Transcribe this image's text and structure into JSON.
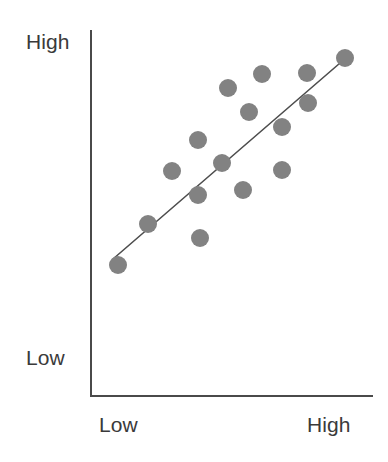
{
  "chart_data": {
    "type": "scatter",
    "title": "",
    "subtitle": "",
    "xlabel": "",
    "ylabel": "",
    "xtick_labels": [
      "Low",
      "High"
    ],
    "ytick_labels": [
      "Low",
      "High"
    ],
    "xlim": [
      0,
      1
    ],
    "ylim": [
      0,
      1
    ],
    "grid": false,
    "legend": null,
    "annotations": [],
    "series": [
      {
        "name": "observations",
        "marker": "circle",
        "color": "#828282",
        "marker_radius_px": 9,
        "points_px": [
          {
            "x": 118,
            "y": 265
          },
          {
            "x": 148,
            "y": 224
          },
          {
            "x": 172,
            "y": 171
          },
          {
            "x": 198,
            "y": 140
          },
          {
            "x": 198,
            "y": 195
          },
          {
            "x": 222,
            "y": 163
          },
          {
            "x": 228,
            "y": 88
          },
          {
            "x": 243,
            "y": 190
          },
          {
            "x": 249,
            "y": 112
          },
          {
            "x": 262,
            "y": 74
          },
          {
            "x": 282,
            "y": 127
          },
          {
            "x": 282,
            "y": 170
          },
          {
            "x": 307,
            "y": 73
          },
          {
            "x": 308,
            "y": 103
          },
          {
            "x": 345,
            "y": 58
          },
          {
            "x": 200,
            "y": 238
          }
        ],
        "x": [
          0.02,
          0.13,
          0.22,
          0.32,
          0.32,
          0.41,
          0.44,
          0.5,
          0.52,
          0.57,
          0.65,
          0.65,
          0.74,
          0.74,
          0.88,
          0.33
        ],
        "y": [
          0.26,
          0.37,
          0.52,
          0.6,
          0.44,
          0.53,
          0.73,
          0.45,
          0.67,
          0.78,
          0.63,
          0.51,
          0.79,
          0.71,
          0.83,
          0.18
        ]
      }
    ],
    "trendline": {
      "name": "fit-line",
      "color": "#4d4d4d",
      "width_px": 1.6,
      "start_px": {
        "x": 113,
        "y": 259
      },
      "end_px": {
        "x": 347,
        "y": 57
      },
      "slope_note": "positive"
    },
    "axes": {
      "color": "#4a4a4a",
      "width_px": 2,
      "y_axis_px": {
        "x": 90,
        "y_top": 30,
        "y_bottom": 396
      },
      "x_axis_px": {
        "y": 396,
        "x_left": 90,
        "x_right": 373
      }
    }
  },
  "labels": {
    "y_high": "High",
    "y_low": "Low",
    "x_low": "Low",
    "x_high": "High"
  },
  "colors": {
    "background": "#ffffff",
    "axis": "#4a4a4a",
    "marker": "#828282",
    "trendline": "#4d4d4d",
    "text": "#3a3a3a"
  }
}
